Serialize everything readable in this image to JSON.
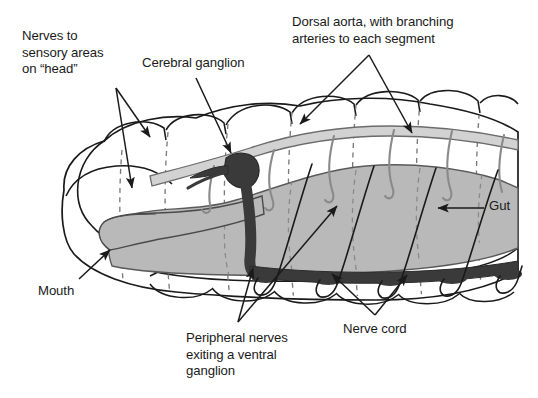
{
  "figure": {
    "background_color": "#ffffff",
    "width": 538,
    "height": 398
  },
  "labels": {
    "nerves_sensory": "Nerves to\nsensory areas\non “head”",
    "cerebral_ganglion": "Cerebral ganglion",
    "dorsal_aorta": "Dorsal aorta, with branching\narteries to each segment",
    "mouth": "Mouth",
    "gut": "Gut",
    "peripheral_nerves": "Peripheral nerves\nexiting a ventral\nganglion",
    "nerve_cord": "Nerve cord"
  },
  "structures": [
    {
      "name": "body-wall",
      "label": "Body wall with segments",
      "fill": "#ffffff",
      "stroke": "#1a1a1a"
    },
    {
      "name": "dorsal-aorta",
      "label": "Dorsal aorta",
      "fill": "#d2d2d2",
      "stroke": "#6b6b6b"
    },
    {
      "name": "branching-arteries",
      "label": "Branching arteries to each segment",
      "fill": "none",
      "stroke": "#8a8a8a",
      "count": 6
    },
    {
      "name": "gut",
      "label": "Gut",
      "fill": "#b9b9b9",
      "stroke": "#5a5a5a"
    },
    {
      "name": "mouth",
      "label": "Mouth",
      "fill": "#b9b9b9",
      "stroke": "#4a4a4a"
    },
    {
      "name": "cerebral-ganglion",
      "label": "Cerebral ganglion",
      "fill": "#3a3a3a",
      "stroke": "#2a2a2a"
    },
    {
      "name": "circumpharyngeal-connective",
      "label": "Connective to ventral nerve cord",
      "fill": "#3a3a3a",
      "stroke": "#2a2a2a"
    },
    {
      "name": "ventral-nerve-cord",
      "label": "Ventral nerve cord with segmental ganglia",
      "fill": "#3a3a3a",
      "stroke": "#2a2a2a",
      "ganglia_count": 6
    },
    {
      "name": "peripheral-nerves",
      "label": "Peripheral nerves exiting ventral ganglia",
      "fill": "none",
      "stroke": "#1a1a1a",
      "count": 5
    },
    {
      "name": "segment-boundaries",
      "label": "Segment boundaries (dashed)",
      "stroke": "#7a7a7a",
      "dash": "5 4",
      "count": 9
    }
  ],
  "leader_lines": [
    {
      "name": "leader-nerves-sensory-a",
      "from_label": "nerves_sensory",
      "points": "116,88 152,140"
    },
    {
      "name": "leader-nerves-sensory-b",
      "from_label": "nerves_sensory",
      "points": "116,88 133,191"
    },
    {
      "name": "leader-cerebral-ganglion",
      "from_label": "cerebral_ganglion",
      "points": "196,78 232,155"
    },
    {
      "name": "leader-dorsal-aorta-a",
      "from_label": "dorsal_aorta",
      "points": "369,55 299,125"
    },
    {
      "name": "leader-dorsal-aorta-b",
      "from_label": "dorsal_aorta",
      "points": "369,55 413,134"
    },
    {
      "name": "leader-mouth",
      "from_label": "mouth",
      "points": "79,279 111,249"
    },
    {
      "name": "leader-gut",
      "from_label": "gut",
      "points": "484,208 436,208"
    },
    {
      "name": "leader-peripheral-nerves-a",
      "from_label": "peripheral_nerves",
      "points": "238,322 254,266"
    },
    {
      "name": "leader-peripheral-nerves-b",
      "from_label": "peripheral_nerves",
      "points": "238,322 338,204"
    },
    {
      "name": "leader-nerve-cord-a",
      "from_label": "nerve_cord",
      "points": "375,315 331,272"
    },
    {
      "name": "leader-nerve-cord-b",
      "from_label": "nerve_cord",
      "points": "375,315 408,273"
    }
  ]
}
